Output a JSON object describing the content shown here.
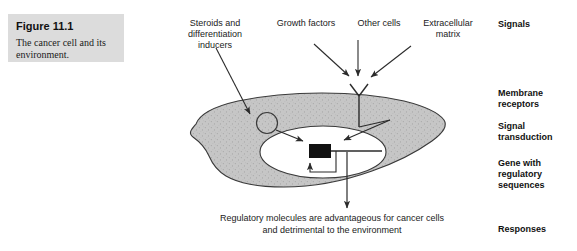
{
  "figure": {
    "caption_title": "Figure 11.1",
    "caption_body": "The cancer cell and its environment."
  },
  "input_labels": [
    {
      "name": "steroids",
      "text": "Steroids and\ndifferentiation\ninducers"
    },
    {
      "name": "growth-factors",
      "text": "Growth factors"
    },
    {
      "name": "other-cells",
      "text": "Other cells"
    },
    {
      "name": "extracellular-matrix",
      "text": "Extracellular\nmatrix"
    }
  ],
  "stage_labels": [
    {
      "name": "signals",
      "text": "Signals"
    },
    {
      "name": "membrane-receptors",
      "text": "Membrane\nreceptors"
    },
    {
      "name": "signal-transduction",
      "text": "Signal\ntransduction"
    },
    {
      "name": "gene-regulatory",
      "text": "Gene with\nregulatory\nsequences"
    },
    {
      "name": "responses",
      "text": "Responses"
    }
  ],
  "outcome": {
    "text": "Regulatory molecules are advantageous for cancer cells\nand detrimental to the environment"
  },
  "colors": {
    "caption_box": "#dcdcdc",
    "cytoplasm": "#c2c2c2",
    "nucleus": "#ffffff",
    "gene_box": "#111111",
    "outline": "#3a3a3a",
    "text": "#222222"
  }
}
